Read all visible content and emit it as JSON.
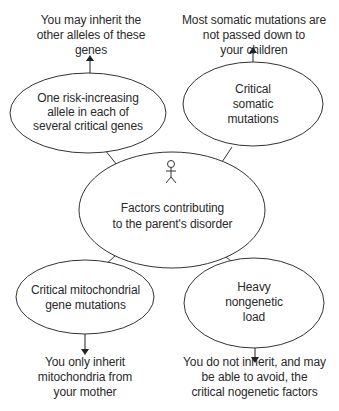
{
  "diagram": {
    "center": {
      "lines": [
        "Factors contributing",
        "to the parent's disorder"
      ],
      "icon": "person-stick-figure-icon"
    },
    "nodes": [
      {
        "id": "risk-alleles",
        "lines": [
          "One risk-increasing",
          "allele in each of",
          "several critical genes"
        ],
        "note": [
          "You may inherit the",
          "other alleles of these",
          "genes"
        ],
        "arrow": "up"
      },
      {
        "id": "somatic",
        "lines": [
          "Critical",
          "somatic",
          "mutations"
        ],
        "note": [
          "Most somatic mutations are",
          "not passed down to",
          "your children"
        ],
        "arrow": "up"
      },
      {
        "id": "mitochondrial",
        "lines": [
          "Critical mitochondrial",
          "gene mutations"
        ],
        "note": [
          "You only inherit",
          "mitochondria from",
          "your mother"
        ],
        "arrow": "down"
      },
      {
        "id": "nongenetic",
        "lines": [
          "Heavy",
          "nongenetic",
          "load"
        ],
        "note": [
          "You do not inherit, and may",
          "be able to avoid, the",
          "critical nogenetic factors"
        ],
        "arrow": "down"
      }
    ],
    "colors": {
      "stroke": "#333333",
      "text": "#2a2a2a",
      "background": "#ffffff"
    }
  }
}
